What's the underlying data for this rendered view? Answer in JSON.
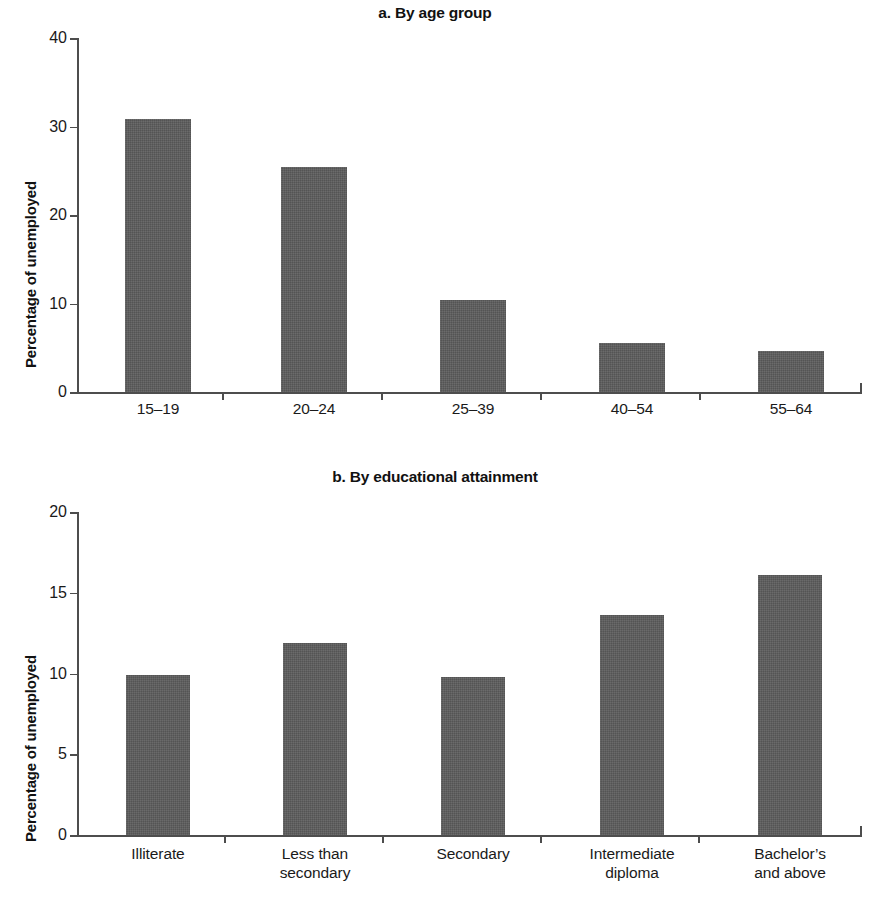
{
  "figure": {
    "width": 870,
    "height": 898,
    "bar_color": "#5c5c5c",
    "axis_color": "#4d4d4d",
    "text_color": "#1a1a1a",
    "background": "#ffffff"
  },
  "chart_data": [
    {
      "type": "bar",
      "panel": "a",
      "title": "a. By age group",
      "xlabel": "",
      "ylabel": "Percentage of unemployed",
      "categories": [
        "15–19",
        "20–24",
        "25–39",
        "40–54",
        "55–64"
      ],
      "values": [
        30.9,
        25.4,
        10.4,
        5.5,
        4.6
      ],
      "ylim": [
        0,
        40
      ],
      "yticks": [
        0,
        10,
        20,
        30,
        40
      ],
      "ytick_labels": [
        "0",
        "10",
        "20",
        "30",
        "40"
      ],
      "grid": false,
      "legend": null
    },
    {
      "type": "bar",
      "panel": "b",
      "title": "b. By educational attainment",
      "xlabel": "",
      "ylabel": "Percentage of unemployed",
      "categories": [
        "Illiterate",
        "Less than\nsecondary",
        "Secondary",
        "Intermediate\ndiploma",
        "Bachelor’s\nand above"
      ],
      "category_lines": [
        [
          "Illiterate"
        ],
        [
          "Less than",
          "secondary"
        ],
        [
          "Secondary"
        ],
        [
          "Intermediate",
          "diploma"
        ],
        [
          "Bachelor’s",
          "and above"
        ]
      ],
      "values": [
        9.9,
        11.9,
        9.8,
        13.6,
        16.1
      ],
      "ylim": [
        0,
        20
      ],
      "yticks": [
        0,
        5,
        10,
        15,
        20
      ],
      "ytick_labels": [
        "0",
        "5",
        "10",
        "15",
        "20"
      ],
      "grid": false,
      "legend": null
    }
  ]
}
